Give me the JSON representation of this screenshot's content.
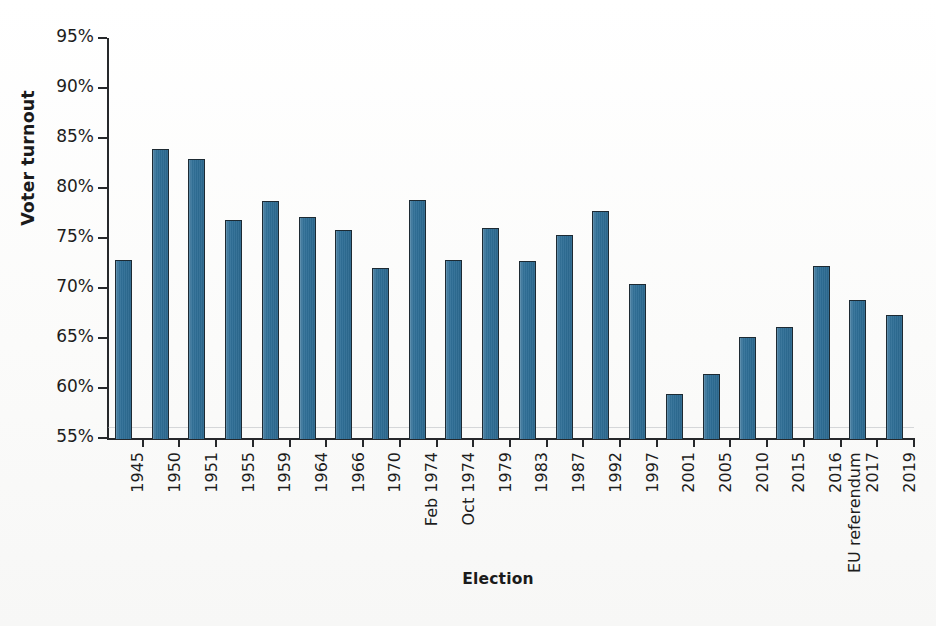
{
  "chart_data": {
    "type": "bar",
    "title": "",
    "xlabel": "Election",
    "ylabel": "Voter turnout",
    "ylim": [
      55,
      95
    ],
    "ytick_labels": [
      "95%",
      "90%",
      "85%",
      "80%",
      "75%",
      "70%",
      "65%",
      "60%",
      "55%"
    ],
    "ytick_values": [
      95,
      90,
      85,
      80,
      75,
      70,
      65,
      60,
      55
    ],
    "grid": false,
    "legend": "none",
    "bar_color": "#2e6e96",
    "bar_edge_color": "#1d2a33",
    "categories": [
      "1945",
      "1950",
      "1951",
      "1955",
      "1959",
      "1964",
      "1966",
      "1970",
      "Feb 1974",
      "Oct 1974",
      "1979",
      "1983",
      "1987",
      "1992",
      "1997",
      "2001",
      "2005",
      "2010",
      "2015",
      "EU referendum 2016",
      "2017",
      "2019"
    ],
    "category_lines": [
      [
        "1945"
      ],
      [
        "1950"
      ],
      [
        "1951"
      ],
      [
        "1955"
      ],
      [
        "1959"
      ],
      [
        "1964"
      ],
      [
        "1966"
      ],
      [
        "1970"
      ],
      [
        "Feb 1974"
      ],
      [
        "Oct 1974"
      ],
      [
        "1979"
      ],
      [
        "1983"
      ],
      [
        "1987"
      ],
      [
        "1992"
      ],
      [
        "1997"
      ],
      [
        "2001"
      ],
      [
        "2005"
      ],
      [
        "2010"
      ],
      [
        "2015"
      ],
      [
        "EU referendum",
        "2016"
      ],
      [
        "2017"
      ],
      [
        "2019"
      ]
    ],
    "values": [
      72.8,
      83.9,
      82.9,
      76.8,
      78.7,
      77.1,
      75.8,
      72.0,
      78.8,
      72.8,
      76.0,
      72.7,
      75.3,
      77.7,
      70.4,
      59.4,
      61.4,
      65.1,
      66.1,
      72.2,
      68.8,
      67.3
    ],
    "units": "%"
  }
}
